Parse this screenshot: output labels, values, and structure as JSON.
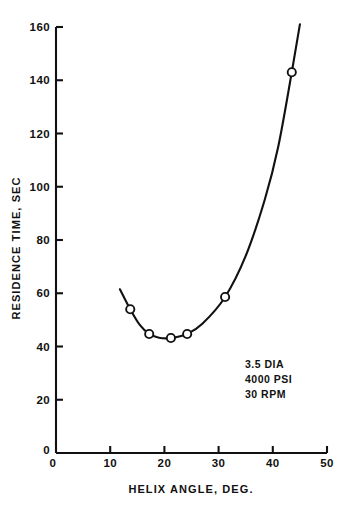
{
  "chart_data": {
    "type": "line",
    "title": "",
    "xlabel": "HELIX ANGLE, DEG.",
    "ylabel": "RESIDENCE TIME, SEC",
    "xlim": [
      0,
      50
    ],
    "ylim": [
      0,
      160
    ],
    "xticks": [
      0,
      10,
      20,
      30,
      40,
      50
    ],
    "xtick_labels": [
      "0",
      "10",
      "20",
      "30",
      "40",
      "50"
    ],
    "yticks": [
      0,
      20,
      40,
      60,
      80,
      100,
      120,
      140,
      160
    ],
    "ytick_labels": [
      "0",
      "20",
      "40",
      "60",
      "80",
      "100",
      "120",
      "140",
      "160"
    ],
    "grid": false,
    "legend": "none",
    "marker": "open-circle",
    "line_color": "#111111",
    "marker_face_color": "#ffffff",
    "series": [
      {
        "name": "residence time",
        "x": [
          13.7,
          17.2,
          21.2,
          24.2,
          31.2,
          43.5
        ],
        "y": [
          54,
          44.7,
          43.2,
          44.7,
          58.6,
          143
        ]
      }
    ],
    "curve_x": [
      11.8,
      13.7,
      15.5,
      17.2,
      19.0,
      21.2,
      24.2,
      27.0,
      31.2,
      35.0,
      38.5,
      41.0,
      43.5,
      45.0
    ],
    "curve_y": [
      61.5,
      54,
      48,
      44.7,
      43.3,
      43.2,
      44.7,
      48.5,
      58.6,
      74,
      95,
      115,
      143,
      161
    ],
    "annotations": [
      {
        "text": "3.5 DIA",
        "x": 35.5,
        "y": 35.5
      },
      {
        "text": "4000 PSI",
        "x": 35.5,
        "y": 30.5
      },
      {
        "text": "30 RPM",
        "x": 35.5,
        "y": 25.5
      }
    ]
  },
  "axis": {
    "x_title": "HELIX ANGLE, DEG.",
    "y_title": "RESIDENCE TIME, SEC"
  },
  "xticks": [
    {
      "label": "0"
    },
    {
      "label": "10"
    },
    {
      "label": "20"
    },
    {
      "label": "30"
    },
    {
      "label": "40"
    },
    {
      "label": "50"
    }
  ],
  "yticks": [
    {
      "label": "0"
    },
    {
      "label": "20"
    },
    {
      "label": "40"
    },
    {
      "label": "60"
    },
    {
      "label": "80"
    },
    {
      "label": "100"
    },
    {
      "label": "120"
    },
    {
      "label": "140"
    },
    {
      "label": "160"
    }
  ],
  "annotation": {
    "line1": "3.5 DIA",
    "line2": "4000 PSI",
    "line3": "30 RPM"
  }
}
